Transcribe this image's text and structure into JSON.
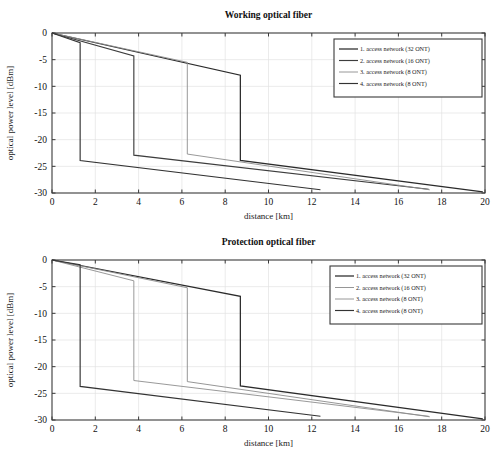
{
  "figure": {
    "width": 503,
    "height": 469,
    "background": "#ffffff"
  },
  "chart_data": [
    {
      "type": "line",
      "panel": "top",
      "title": "Working optical fiber",
      "xlabel": "distance [km]",
      "ylabel": "optical power level [dBm]",
      "xlim": [
        0,
        20
      ],
      "ylim": [
        -30,
        0
      ],
      "xticks": [
        0,
        2,
        4,
        6,
        8,
        10,
        12,
        14,
        16,
        18,
        20
      ],
      "xticklabels": [
        "0",
        "2",
        "4",
        "6",
        "8",
        "10",
        "12",
        "14",
        "16",
        "18",
        "20"
      ],
      "yticks": [
        0,
        -5,
        -10,
        -15,
        -20,
        -25,
        -30
      ],
      "yticklabels": [
        "0",
        "-5",
        "-10",
        "-15",
        "-20",
        "-25",
        "-30"
      ],
      "grid": true,
      "legend_position": "upper right",
      "series": [
        {
          "name": "1. access network (32 ONT)",
          "color": "#2b2b2b",
          "width": 1.25,
          "points": [
            [
              0,
              0
            ],
            [
              8.7,
              -7.9
            ],
            [
              8.7,
              -23.9
            ],
            [
              19.9,
              -29.8
            ]
          ]
        },
        {
          "name": "2. access network (16 ONT)",
          "color": "#3d3d3d",
          "width": 1.15,
          "points": [
            [
              0,
              0
            ],
            [
              3.78,
              -4.3
            ],
            [
              3.78,
              -22.9
            ],
            [
              17.4,
              -29.3
            ]
          ]
        },
        {
          "name": "3. access network (8 ONT)",
          "color": "#8d8d8d",
          "width": 0.9,
          "points": [
            [
              0,
              0
            ],
            [
              6.25,
              -5.5
            ],
            [
              6.25,
              -22.7
            ],
            [
              17.45,
              -29.4
            ]
          ]
        },
        {
          "name": "4. access network (8 ONT)",
          "color": "#333333",
          "width": 1.15,
          "points": [
            [
              0,
              0
            ],
            [
              1.3,
              -1.8
            ],
            [
              1.3,
              -23.9
            ],
            [
              12.4,
              -29.4
            ]
          ]
        }
      ]
    },
    {
      "type": "line",
      "panel": "bottom",
      "title": "Protection optical fiber",
      "xlabel": "distance [km]",
      "ylabel": "optical power level [dBm]",
      "xlim": [
        0,
        20
      ],
      "ylim": [
        -30,
        0
      ],
      "xticks": [
        0,
        2,
        4,
        6,
        8,
        10,
        12,
        14,
        16,
        18,
        20
      ],
      "xticklabels": [
        "0",
        "2",
        "4",
        "6",
        "8",
        "10",
        "12",
        "14",
        "16",
        "18",
        "20"
      ],
      "yticks": [
        0,
        -5,
        -10,
        -15,
        -20,
        -25,
        -30
      ],
      "yticklabels": [
        "0",
        "-5",
        "-10",
        "-15",
        "-20",
        "-25",
        "-30"
      ],
      "grid": true,
      "legend_position": "upper right",
      "series": [
        {
          "name": "1. access network (32 ONT)",
          "color": "#2b2b2b",
          "width": 1.25,
          "points": [
            [
              0,
              0
            ],
            [
              8.7,
              -6.8
            ],
            [
              8.7,
              -23.6
            ],
            [
              19.9,
              -29.8
            ]
          ]
        },
        {
          "name": "2. access network (16 ONT)",
          "color": "#8a8a8a",
          "width": 0.9,
          "points": [
            [
              0,
              0
            ],
            [
              6.25,
              -5.2
            ],
            [
              6.25,
              -22.8
            ],
            [
              17.45,
              -29.4
            ]
          ]
        },
        {
          "name": "3. access network (8 ONT)",
          "color": "#8d8d8d",
          "width": 0.9,
          "points": [
            [
              0,
              0
            ],
            [
              3.78,
              -3.9
            ],
            [
              3.78,
              -22.6
            ],
            [
              17.4,
              -29.3
            ]
          ]
        },
        {
          "name": "4. access network (8 ONT)",
          "color": "#333333",
          "width": 1.15,
          "points": [
            [
              0,
              0
            ],
            [
              1.3,
              -0.9
            ],
            [
              1.3,
              -23.7
            ],
            [
              12.4,
              -29.3
            ]
          ]
        }
      ]
    }
  ]
}
